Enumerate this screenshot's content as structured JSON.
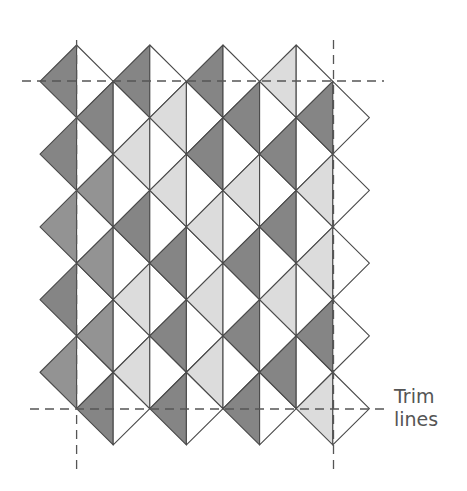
{
  "diagram": {
    "type": "quilt-layout",
    "grid": {
      "x0": 40,
      "dx": 36.6,
      "y0": 45,
      "dy": 36.36,
      "columns": 8
    },
    "colors": {
      "dark": "#858585",
      "medium": "#939393",
      "light": "#dcdcdc",
      "white": "#ffffff",
      "stroke": "#4a4a4a",
      "trim": "#555555",
      "text": "#555555"
    },
    "diamonds": [
      {
        "col": 1,
        "rows": [
          1,
          3,
          5,
          7,
          9
        ],
        "left": [
          "dark",
          "dark",
          "medium",
          "dark",
          "medium"
        ],
        "right": [
          "white",
          "white",
          "white",
          "white",
          "white"
        ]
      },
      {
        "col": 2,
        "rows": [
          2,
          4,
          6,
          8,
          10
        ],
        "left": [
          "dark",
          "medium",
          "medium",
          "medium",
          "dark"
        ],
        "right": [
          "white",
          "white",
          "white",
          "white",
          "white"
        ]
      },
      {
        "col": 3,
        "rows": [
          1,
          3,
          5,
          7,
          9
        ],
        "left": [
          "dark",
          "light",
          "dark",
          "light",
          "light"
        ],
        "right": [
          "white",
          "white",
          "white",
          "white",
          "white"
        ]
      },
      {
        "col": 4,
        "rows": [
          2,
          4,
          6,
          8,
          10
        ],
        "left": [
          "light",
          "light",
          "dark",
          "dark",
          "dark"
        ],
        "right": [
          "white",
          "white",
          "white",
          "white",
          "white"
        ]
      },
      {
        "col": 5,
        "rows": [
          1,
          3,
          5,
          7,
          9
        ],
        "left": [
          "dark",
          "dark",
          "light",
          "light",
          "light"
        ],
        "right": [
          "white",
          "white",
          "white",
          "white",
          "white"
        ]
      },
      {
        "col": 6,
        "rows": [
          2,
          4,
          6,
          8,
          10
        ],
        "left": [
          "dark",
          "light",
          "dark",
          "dark",
          "dark"
        ],
        "right": [
          "white",
          "white",
          "white",
          "white",
          "white"
        ]
      },
      {
        "col": 7,
        "rows": [
          1,
          3,
          5,
          7,
          9
        ],
        "left": [
          "light",
          "dark",
          "dark",
          "light",
          "dark"
        ],
        "right": [
          "white",
          "white",
          "white",
          "white",
          "white"
        ]
      },
      {
        "col": 8,
        "rows": [
          2,
          4,
          6,
          8,
          10
        ],
        "left": [
          "dark",
          "light",
          "light",
          "dark",
          "light"
        ],
        "right": [
          "white",
          "white",
          "white",
          "white",
          "white"
        ]
      }
    ],
    "trim_lines": {
      "horizontal": [
        {
          "y": 81,
          "x1": 22,
          "x2": 384
        },
        {
          "y": 409,
          "x1": 30,
          "x2": 390
        }
      ],
      "vertical": [
        {
          "x": 76.6,
          "y1": 40,
          "y2": 470
        },
        {
          "x": 333.5,
          "y1": 40,
          "y2": 470
        }
      ]
    },
    "label": {
      "line1": "Trim",
      "line2": "lines"
    }
  }
}
